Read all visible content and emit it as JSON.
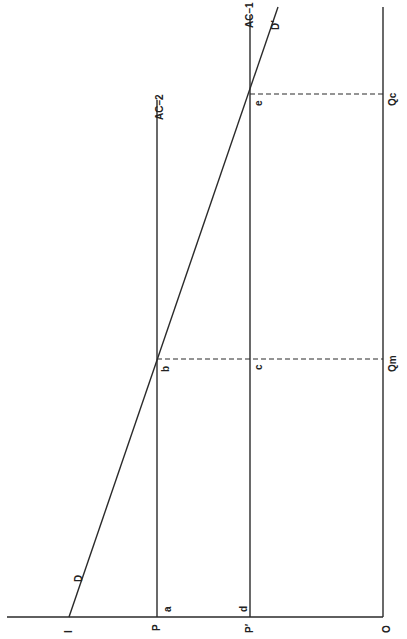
{
  "diagram": {
    "orientation": "rotated 90 degrees counter-clockwise",
    "axis_labels": {
      "origin": "O",
      "price_p": "P",
      "price_p_prime": "P′",
      "intercept": "I",
      "qty_m": "Qm",
      "qty_c": "Qc"
    },
    "curve_labels": {
      "demand": "D",
      "demand_prime": "D′",
      "ac1": "AC–1",
      "ac2": "AC–2"
    },
    "point_labels": {
      "a": "a",
      "b": "b",
      "c": "c",
      "d": "d",
      "e": "e"
    }
  }
}
